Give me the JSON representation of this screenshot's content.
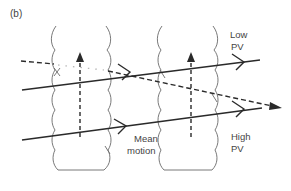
{
  "panel_label": "(b)",
  "labels": {
    "low_pv_line1": "Low",
    "low_pv_line2": "PV",
    "high_pv_line1": "High",
    "high_pv_line2": "PV",
    "mean_motion_line1": "Mean",
    "mean_motion_line2": "motion"
  },
  "colors": {
    "line": "#2a2a2a",
    "tube": "#6a6a6a",
    "text": "#444444",
    "background": "#ffffff"
  },
  "elements": {
    "tubes": [
      "left-vortex-tube",
      "right-vortex-tube"
    ],
    "solid_trajectories": [
      "upper-solid-trajectory",
      "lower-solid-trajectory"
    ],
    "dashed_trajectory": "dashed-trajectory",
    "vertical_arrows": [
      "left-mean-motion-arrow",
      "right-mean-motion-arrow"
    ]
  }
}
